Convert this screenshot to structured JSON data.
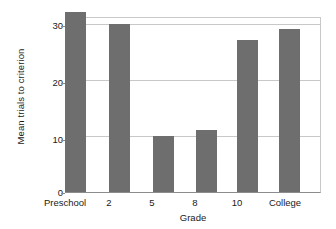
{
  "chart_data": {
    "type": "bar",
    "title": "",
    "xlabel": "Grade",
    "ylabel": "Mean trials to criterion",
    "categories": [
      "Preschool",
      "2",
      "5",
      "8",
      "10",
      "College"
    ],
    "values": [
      32,
      30,
      10,
      11,
      27,
      29
    ],
    "series": [
      {
        "name": "Mean trials to criterion",
        "values": [
          32,
          30,
          10,
          11,
          27,
          29
        ]
      }
    ],
    "ylim": [
      0,
      31
    ],
    "yticks": [
      0,
      10,
      20,
      30
    ],
    "ytick_labels": [
      "0",
      "10",
      "20",
      "30"
    ],
    "grid": true,
    "grid_axis": "y",
    "legend": false,
    "legend_position": "none",
    "bar_color": "#6e6e6e",
    "axis_color": "#8c8c8c",
    "grid_color": "#c8c8c8",
    "background_color": "#ffffff",
    "text_color": "#1a1a1a"
  }
}
